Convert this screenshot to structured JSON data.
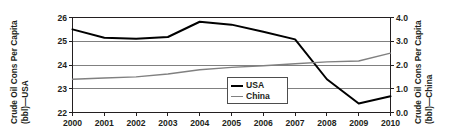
{
  "chart_data": {
    "type": "line",
    "title": "",
    "xlabel": "",
    "categories": [
      2000,
      2001,
      2002,
      2003,
      2004,
      2005,
      2006,
      2007,
      2008,
      2009,
      2010
    ],
    "xlim": [
      2000,
      2010
    ],
    "grid": true,
    "legend_position": "inside-bottom-center",
    "axes": {
      "left": {
        "label_line1": "Crude Oil Cons Per Capita",
        "label_line2": "(bbl)—USA",
        "ylim": [
          22,
          26
        ],
        "ticks": [
          "22",
          "23",
          "24",
          "25",
          "26"
        ],
        "tick_values": [
          22,
          23,
          24,
          25,
          26
        ]
      },
      "right": {
        "label_line1": "Crude Oil Cons Per Capita",
        "label_line2": "(bbl)—China",
        "ylim": [
          0.0,
          4.0
        ],
        "ticks": [
          "0.0",
          "1.0",
          "2.0",
          "3.0",
          "4.0"
        ],
        "tick_values": [
          0.0,
          1.0,
          2.0,
          3.0,
          4.0
        ]
      }
    },
    "xticks": [
      "2000",
      "2001",
      "2002",
      "2003",
      "2004",
      "2005",
      "2006",
      "2007",
      "2008",
      "2009",
      "2010"
    ],
    "series": [
      {
        "name": "USA",
        "axis": "left",
        "color": "#000000",
        "width": 2.0,
        "values": [
          25.5,
          25.15,
          25.1,
          25.18,
          25.82,
          25.7,
          25.4,
          25.08,
          23.4,
          22.38,
          22.68
        ]
      },
      {
        "name": "China",
        "axis": "right",
        "color": "#808080",
        "width": 1.4,
        "values": [
          1.4,
          1.45,
          1.5,
          1.62,
          1.8,
          1.9,
          1.97,
          2.05,
          2.13,
          2.17,
          2.5
        ]
      }
    ]
  },
  "legend": {
    "items": [
      {
        "label": "USA"
      },
      {
        "label": "China"
      }
    ]
  },
  "colors": {
    "usa": "#000000",
    "china": "#808080",
    "axis": "#231f20",
    "grid": "#808080",
    "background": "#ffffff"
  }
}
